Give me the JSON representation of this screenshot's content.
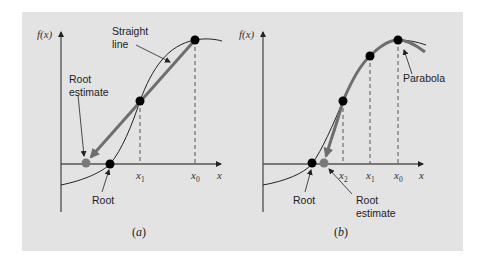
{
  "figure": {
    "background_color": "#e3e3e3",
    "curve_color": "#222222",
    "thick_line_color": "#6e6e6e",
    "estimate_point_color": "#7a7a7a",
    "point_color": "#000000"
  },
  "panel_a": {
    "caption_open": "(",
    "caption_letter": "a",
    "caption_close": ")",
    "y_axis_label": "f(x)",
    "x_axis_label": "x",
    "ticks": [
      {
        "base": "x",
        "sub": "1"
      },
      {
        "base": "x",
        "sub": "0"
      }
    ],
    "annotations": {
      "straight_line_1": "Straight",
      "straight_line_2": "line",
      "root_estimate_1": "Root",
      "root_estimate_2": "estimate",
      "root": "Root"
    }
  },
  "panel_b": {
    "caption_open": "(",
    "caption_letter": "b",
    "caption_close": ")",
    "y_axis_label": "f(x)",
    "x_axis_label": "x",
    "ticks": [
      {
        "base": "x",
        "sub": "2"
      },
      {
        "base": "x",
        "sub": "1"
      },
      {
        "base": "x",
        "sub": "0"
      }
    ],
    "annotations": {
      "parabola": "Parabola",
      "root": "Root",
      "root_estimate_1": "Root",
      "root_estimate_2": "estimate"
    }
  }
}
